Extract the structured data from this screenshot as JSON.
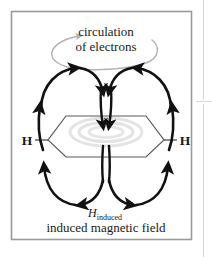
{
  "figure": {
    "background_color": "#ffffff",
    "frame_color": "#9a9a9a",
    "field_line_color": "#111111",
    "ring_color": "#4a4a4a",
    "circulation_color": "#b4b4b4",
    "pi_cloud_color": "#dcdcdc",
    "text_color": "#1a1a1a"
  },
  "labels": {
    "circulation_line1": "circulation",
    "circulation_line2": "of electrons",
    "atom_left": "H",
    "atom_right": "H",
    "field_symbol": "H",
    "field_subscript": "induced",
    "caption": "induced magnetic field"
  },
  "diagram": {
    "molecule": "benzene ring",
    "field_loops": 4,
    "center_arrows": 2,
    "circulation_direction": "clockwise"
  }
}
